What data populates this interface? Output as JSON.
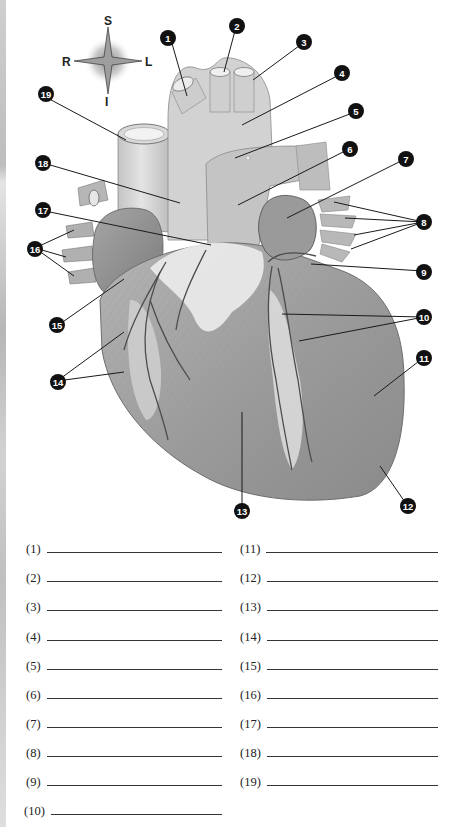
{
  "compass": {
    "superior": "S",
    "inferior": "I",
    "right": "R",
    "left": "L"
  },
  "callouts": [
    {
      "n": "1"
    },
    {
      "n": "2"
    },
    {
      "n": "3"
    },
    {
      "n": "4"
    },
    {
      "n": "5"
    },
    {
      "n": "6"
    },
    {
      "n": "7"
    },
    {
      "n": "8"
    },
    {
      "n": "9"
    },
    {
      "n": "10"
    },
    {
      "n": "11"
    },
    {
      "n": "12"
    },
    {
      "n": "13"
    },
    {
      "n": "14"
    },
    {
      "n": "15"
    },
    {
      "n": "16"
    },
    {
      "n": "17"
    },
    {
      "n": "18"
    },
    {
      "n": "19"
    }
  ],
  "worksheet": {
    "left_column": [
      {
        "label": "(1)",
        "value": ""
      },
      {
        "label": "(2)",
        "value": ""
      },
      {
        "label": "(3)",
        "value": ""
      },
      {
        "label": "(4)",
        "value": ""
      },
      {
        "label": "(5)",
        "value": ""
      },
      {
        "label": "(6)",
        "value": ""
      },
      {
        "label": "(7)",
        "value": ""
      },
      {
        "label": "(8)",
        "value": ""
      },
      {
        "label": "(9)",
        "value": ""
      },
      {
        "label": "(10)",
        "value": ""
      }
    ],
    "right_column": [
      {
        "label": "(11)",
        "value": ""
      },
      {
        "label": "(12)",
        "value": ""
      },
      {
        "label": "(13)",
        "value": ""
      },
      {
        "label": "(14)",
        "value": ""
      },
      {
        "label": "(15)",
        "value": ""
      },
      {
        "label": "(16)",
        "value": ""
      },
      {
        "label": "(17)",
        "value": ""
      },
      {
        "label": "(18)",
        "value": ""
      },
      {
        "label": "(19)",
        "value": ""
      }
    ]
  },
  "colors": {
    "callout_fill": "#111111",
    "callout_text": "#ffffff",
    "leader_line": "#1a1a1a",
    "heart_light": "#d9d9d9",
    "heart_mid": "#a8a8a8",
    "heart_dark": "#7d7d7d",
    "fat_highlight": "#ececec"
  }
}
